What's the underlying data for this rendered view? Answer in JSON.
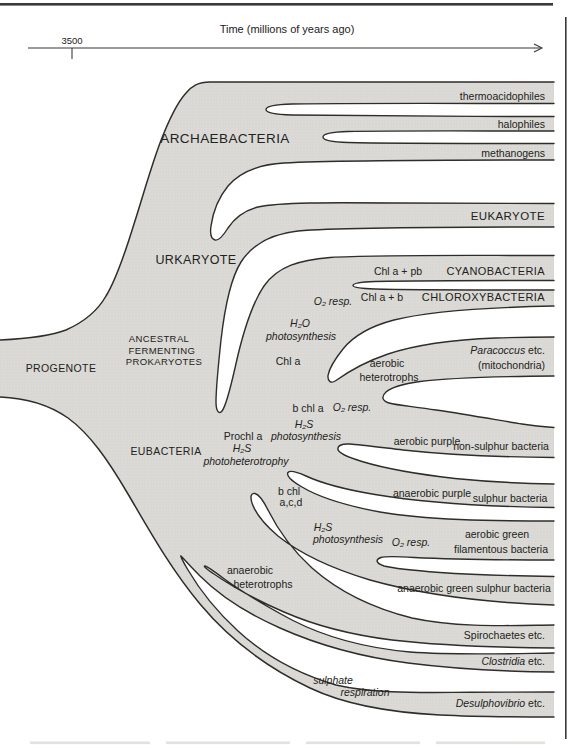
{
  "colors": {
    "band_fill": "#dbdad6",
    "band_dot": "#cfcec9",
    "outline": "#2e2d2a",
    "text": "#222220",
    "rule": "#3a3936"
  },
  "header": {
    "time_axis_label": "Time (millions of years ago)",
    "tick_label": "3500"
  },
  "tree": {
    "progenote": "PROGENOTE",
    "ancestral_line1": "ANCESTRAL",
    "ancestral_line2": "FERMENTING",
    "ancestral_line3": "PROKARYOTES",
    "archaebacteria": "ARCHAEBACTERIA",
    "urkaryote": "URKARYOTE",
    "eubacteria": "EUBACTERIA",
    "thermoacidophiles": "thermoacidophiles",
    "halophiles": "halophiles",
    "methanogens": "methanogens",
    "eukaryote": "EUKARYOTE",
    "cyanobacteria": "CYANOBACTERIA",
    "chloroxybacteria": "CHLOROXYBACTERIA",
    "chl_a_pb": "Chl a + pb",
    "chl_a_b": "Chl a + b",
    "o2_resp_1": "O₂ resp.",
    "h2o": "H₂O",
    "photosynthesis_1": "photosynthesis",
    "chl_a": "Chl a",
    "aerobic": "aerobic",
    "heterotrophs": "heterotrophs",
    "paracoccus_i": "Paracoccus",
    "paracoccus_etc": " etc.",
    "mitochondria": "(mitochondria)",
    "b_chl_a": "b chl a",
    "o2_resp_2": "O₂ resp.",
    "h2s_1": "H₂S",
    "photosynthesis_2": "photosynthesis",
    "prochl_a": "Prochl a",
    "h2s_2": "H₂S",
    "photoheterotrophy": "photoheterotrophy",
    "aerobic_purple": "aerobic purple",
    "non_sulphur": "non-sulphur bacteria",
    "anaerobic_purple": "anaerobic purple",
    "sulphur_bacteria": "sulphur bacteria",
    "b_chl": "b chl",
    "acd": "a,c,d",
    "h2s_3": "H₂S",
    "photosynthesis_3": "photosynthesis",
    "o2_resp_3": "O₂ resp.",
    "aerobic_green": "aerobic green",
    "filamentous": "filamentous bacteria",
    "anaerobic_green": "anaerobic green sulphur bacteria",
    "anaerobic_het_1": "anaerobic",
    "anaerobic_het_2": "heterotrophs",
    "spirochaetes": "Spirochaetes etc.",
    "clostridia_i": "Clostridia",
    "clostridia_etc": " etc.",
    "sulphate": "sulphate",
    "respiration": "respiration",
    "desulphovibrio_i": "Desulphovibrio",
    "desulphovibrio_etc": " etc."
  }
}
